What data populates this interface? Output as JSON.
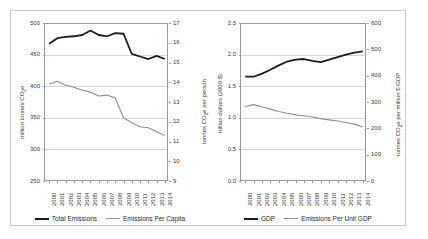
{
  "figure": {
    "border_color": "#c9c9c9",
    "background": "#ffffff",
    "series_dark_color": "#1d1d1d",
    "series_light_color": "#8f8f8f"
  },
  "chart_data": [
    {
      "type": "line",
      "panel": "left",
      "title": "",
      "xlabel": "",
      "ylabel": "million tonnes CO2e",
      "y2label": "tonnes CO2e per person",
      "grid": true,
      "legend_position": "bottom",
      "x": [
        "2000",
        "2001",
        "2002",
        "2003",
        "2004",
        "2005",
        "2006",
        "2007",
        "2008",
        "2009",
        "2010",
        "2011",
        "2012",
        "2013",
        "2014"
      ],
      "ylim": [
        250,
        500
      ],
      "yticks": [
        250,
        300,
        350,
        400,
        450,
        500
      ],
      "y2lim": [
        9,
        17
      ],
      "y2ticks": [
        9,
        10,
        11,
        12,
        13,
        14,
        15,
        16,
        17
      ],
      "series": [
        {
          "name": "Total Emissions",
          "axis": "left",
          "color": "#1d1d1d",
          "values": [
            467,
            476,
            478,
            479,
            481,
            488,
            481,
            479,
            484,
            483,
            451,
            447,
            443,
            448,
            443
          ]
        },
        {
          "name": "Emissions Per Capita",
          "axis": "right",
          "color": "#8f8f8f",
          "values": [
            13.9,
            14.05,
            13.85,
            13.75,
            13.6,
            13.5,
            13.3,
            13.35,
            13.2,
            12.2,
            11.95,
            11.75,
            11.7,
            11.5,
            11.3
          ]
        }
      ]
    },
    {
      "type": "line",
      "panel": "right",
      "title": "",
      "xlabel": "",
      "ylabel": "trillion dollars (2009 $)",
      "y2label": "tonnes CO2e per million $ GDP",
      "grid": true,
      "legend_position": "bottom",
      "x": [
        "2000",
        "2001",
        "2002",
        "2003",
        "2004",
        "2005",
        "2006",
        "2007",
        "2008",
        "2009",
        "2010",
        "2011",
        "2012",
        "2013",
        "2014"
      ],
      "ylim": [
        0.0,
        2.5
      ],
      "yticks": [
        0.0,
        0.5,
        1.0,
        1.5,
        2.0,
        2.5
      ],
      "y2lim": [
        0,
        600
      ],
      "y2ticks": [
        0,
        100,
        200,
        300,
        400,
        500,
        600
      ],
      "series": [
        {
          "name": "GDP",
          "axis": "left",
          "color": "#1d1d1d",
          "values": [
            1.65,
            1.65,
            1.7,
            1.76,
            1.83,
            1.89,
            1.92,
            1.93,
            1.9,
            1.88,
            1.92,
            1.96,
            2.0,
            2.03,
            2.05
          ]
        },
        {
          "name": "Emissions Per Unit GDP",
          "axis": "right",
          "color": "#8f8f8f",
          "values": [
            283,
            290,
            282,
            273,
            264,
            257,
            251,
            248,
            243,
            237,
            232,
            228,
            222,
            216,
            205
          ]
        }
      ]
    }
  ],
  "axes": {
    "left_panel": {
      "y_tick_labels": [
        "500",
        "450",
        "400",
        "350",
        "300",
        "250"
      ],
      "y2_tick_labels": [
        "17",
        "16",
        "15",
        "14",
        "13",
        "12",
        "11",
        "10",
        "9"
      ],
      "y_title_prefix": "million tonnes CO",
      "y_title_sub": "2",
      "y_title_suffix": "e",
      "y2_title_prefix": "tonnes CO",
      "y2_title_sub": "2",
      "y2_title_suffix": "e per person"
    },
    "right_panel": {
      "y_tick_labels": [
        "2.5",
        "2.0",
        "1.5",
        "1.0",
        "0.5",
        "0.0"
      ],
      "y2_tick_labels": [
        "600",
        "500",
        "400",
        "300",
        "200",
        "100",
        "0"
      ],
      "y_title": "trillion dollars (2009 $)",
      "y2_title_prefix": "tonnes CO",
      "y2_title_sub": "2",
      "y2_title_suffix": "e per million $ GDP"
    },
    "x_tick_labels": [
      "2000",
      "2001",
      "2002",
      "2003",
      "2004",
      "2005",
      "2006",
      "2007",
      "2008",
      "2009",
      "2010",
      "2011",
      "2012",
      "2013",
      "2014"
    ]
  },
  "legends": {
    "left": [
      {
        "label": "Total Emissions",
        "style": "dark"
      },
      {
        "label": "Emissions Per Capita",
        "style": "light"
      }
    ],
    "right": [
      {
        "label": "GDP",
        "style": "dark"
      },
      {
        "label": "Emissions Per Unit GDP",
        "style": "light"
      }
    ]
  }
}
